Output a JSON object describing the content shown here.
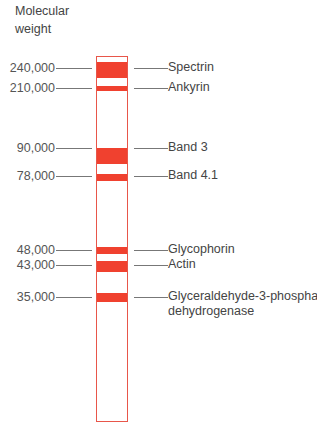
{
  "axis_title": "Molecular\nweight",
  "lane": {
    "top": 56,
    "bottom": 422,
    "left": 96,
    "right": 128,
    "border_color": "#e8564a"
  },
  "band_color": "#f0412f",
  "bands": [
    {
      "mw": "240,000",
      "protein": "Spectrin",
      "top": 62,
      "height": 16,
      "line_y": 68
    },
    {
      "mw": "210,000",
      "protein": "Ankyrin",
      "top": 86,
      "height": 5,
      "line_y": 88
    },
    {
      "mw": "90,000",
      "protein": "Band 3",
      "top": 148,
      "height": 16,
      "line_y": 148
    },
    {
      "mw": "78,000",
      "protein": "Band 4.1",
      "top": 174,
      "height": 7,
      "line_y": 176
    },
    {
      "mw": "48,000",
      "protein": "Glycophorin",
      "top": 247,
      "height": 7,
      "line_y": 250
    },
    {
      "mw": "43,000",
      "protein": "Actin",
      "top": 261,
      "height": 11,
      "line_y": 265
    },
    {
      "mw": "35,000",
      "protein": "Glyceraldehyde-3-phosphate",
      "protein_line2": "dehydrogenase",
      "top": 293,
      "height": 9,
      "line_y": 297
    }
  ]
}
